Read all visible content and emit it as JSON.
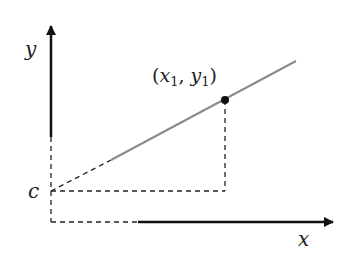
{
  "diagram": {
    "type": "linear-function-graph",
    "axes": {
      "x_label": "x",
      "y_label": "y",
      "color": "#111111"
    },
    "intercept_label": "c",
    "point": {
      "label_x": "x",
      "label_x_sub": "1",
      "label_y": "y",
      "label_y_sub": "1",
      "label_open": "(",
      "label_sep": ", ",
      "label_close": ")",
      "color": "#111111"
    },
    "line_color": "#8a8a8a",
    "dashed_color": "#222222"
  }
}
